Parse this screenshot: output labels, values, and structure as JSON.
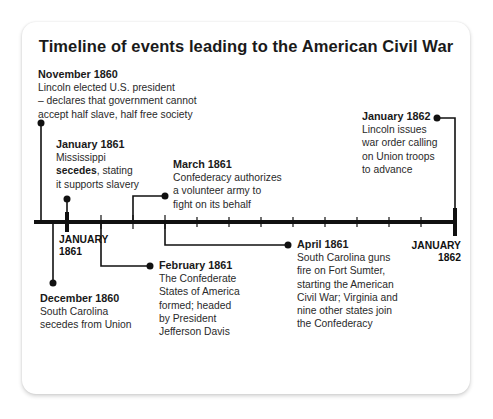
{
  "title": "Timeline of events leading to the American Civil War",
  "axis": {
    "start_label_line1": "JANUARY",
    "start_label_line2": "1861",
    "end_label_line1": "JANUARY",
    "end_label_line2": "1862"
  },
  "events": {
    "nov1860": {
      "date": "November 1860",
      "line1": "Lincoln elected U.S. president",
      "line2": "– declares that government cannot",
      "line3": "accept half slave, half free society"
    },
    "dec1860": {
      "date": "December 1860",
      "line1": "South Carolina",
      "line2": "secedes from Union"
    },
    "jan1861": {
      "date": "January 1861",
      "line1": "Mississippi",
      "line2_bold": "secedes",
      "line2_rest": ", stating",
      "line3": "it supports slavery"
    },
    "feb1861": {
      "date": "February 1861",
      "line1": "The Confederate",
      "line2": "States of America",
      "line3": "formed; headed",
      "line4": "by President",
      "line5": "Jefferson Davis"
    },
    "mar1861": {
      "date": "March 1861",
      "line1": "Confederacy authorizes",
      "line2": "a volunteer army to",
      "line3": "fight on its behalf"
    },
    "apr1861": {
      "date": "April 1861",
      "line1": "South Carolina guns",
      "line2": "fire on Fort Sumter,",
      "line3": "starting the American",
      "line4": "Civil War; Virginia and",
      "line5": "nine other states join",
      "line6": "the Confederacy"
    },
    "jan1862": {
      "date": "January 1862",
      "line1": "Lincoln issues",
      "line2": "war order calling",
      "line3": "on Union troops",
      "line4": "to advance"
    }
  },
  "colors": {
    "line": "#111111",
    "text": "#2a2a2a",
    "card": "#ffffff"
  }
}
